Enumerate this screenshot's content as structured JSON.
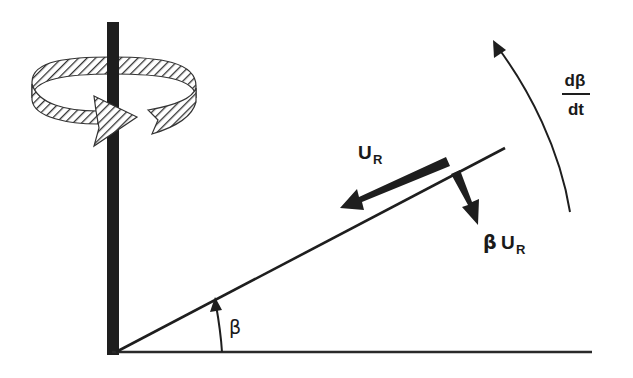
{
  "diagram": {
    "type": "physics-kinematics",
    "colors": {
      "ink": "#1a1a1a",
      "background": "#ffffff",
      "hatch": "#333333"
    },
    "labels": {
      "u_r": {
        "main": "U",
        "sub": "R"
      },
      "beta_u_r": {
        "prefix": "β",
        "main": "U",
        "sub": "R"
      },
      "angle": "β",
      "rate": {
        "numerator": "dβ",
        "denominator": "dt"
      }
    },
    "elements": [
      {
        "id": "vertical-axis",
        "kind": "thick-bar"
      },
      {
        "id": "horizontal-baseline",
        "kind": "line"
      },
      {
        "id": "inclined-line",
        "kind": "line"
      },
      {
        "id": "rotation-ribbon",
        "kind": "hatched-curved-arrow",
        "meaning": "rotation about vertical axis"
      },
      {
        "id": "radial-velocity-arrow",
        "kind": "arrow",
        "label": "U_R"
      },
      {
        "id": "normal-velocity-arrow",
        "kind": "arrow",
        "label": "β U_R"
      },
      {
        "id": "angle-arc-arrow",
        "kind": "arrow",
        "label": "β"
      },
      {
        "id": "angular-rate-arrow",
        "kind": "curved-arrow",
        "label": "dβ/dt"
      }
    ]
  }
}
